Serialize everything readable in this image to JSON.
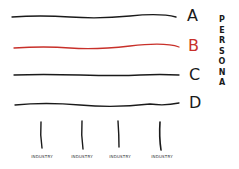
{
  "diagram": {
    "rows": [
      {
        "label": "A",
        "color": "#1a1a1a",
        "y": 17
      },
      {
        "label": "B",
        "color": "#c8302a",
        "y": 47
      },
      {
        "label": "C",
        "color": "#1a1a1a",
        "y": 75
      },
      {
        "label": "D",
        "color": "#1a1a1a",
        "y": 104
      }
    ],
    "side_label": {
      "text": "PERSONA",
      "letters": [
        "P",
        "E",
        "R",
        "S",
        "O",
        "N",
        "A"
      ]
    },
    "columns": [
      {
        "label": "INDUSTRY",
        "x": 41
      },
      {
        "label": "INDUSTRY",
        "x": 82
      },
      {
        "label": "INDUSTRY",
        "x": 119
      },
      {
        "label": "INDUSTRY",
        "x": 160
      }
    ],
    "colors": {
      "ink": "#1a1a1a",
      "accent": "#c8302a",
      "background": "#ffffff"
    }
  }
}
